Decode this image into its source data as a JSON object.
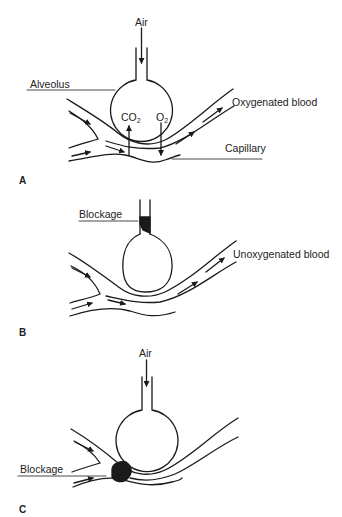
{
  "figure": {
    "panels": [
      {
        "id": "A",
        "label": "A",
        "labels": {
          "air": "Air",
          "alveolus": "Alveolus",
          "co2": "CO",
          "co2_sub": "2",
          "o2": "O",
          "o2_sub": "2",
          "oxygenated_blood": "Oxygenated blood",
          "capillary": "Capillary"
        }
      },
      {
        "id": "B",
        "label": "B",
        "labels": {
          "blockage": "Blockage",
          "unoxygenated_blood": "Unoxygenated blood"
        }
      },
      {
        "id": "C",
        "label": "C",
        "labels": {
          "air": "Air",
          "blockage": "Blockage"
        }
      }
    ],
    "colors": {
      "line": "#1a1a1a",
      "background": "#ffffff"
    }
  }
}
